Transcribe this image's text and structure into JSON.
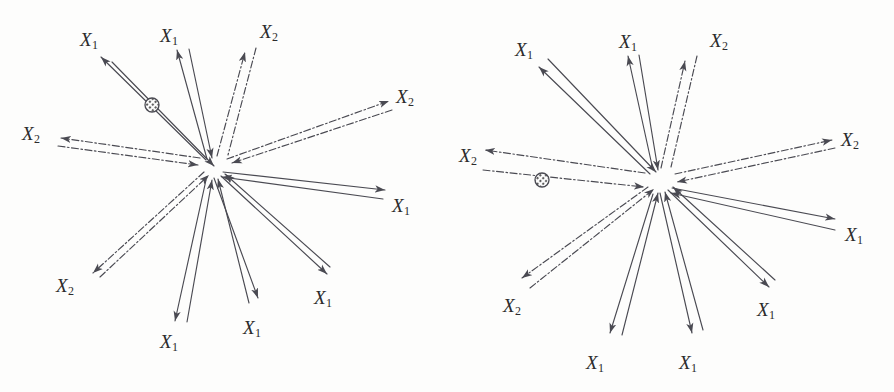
{
  "figure": {
    "background_color": "#fdfdfc",
    "stroke_color": "#4a4a52",
    "label_color": "#2b2b2b",
    "panel_count": 2
  },
  "legend": {
    "x1_symbol": "X",
    "x1_subscript": "1",
    "x2_symbol": "X",
    "x2_subscript": "2",
    "x1_line_style": "solid",
    "x2_line_style": "dash-dot"
  },
  "panels": [
    {
      "id": "panel-left",
      "name": "left-panel",
      "hub": {
        "x": 210,
        "y": 167
      },
      "particle": {
        "x": 152,
        "y": 105,
        "r": 7,
        "name": "hatched-circle-marker"
      },
      "rays": [
        {
          "name": "ray-x1-upper-left",
          "series": "X1",
          "style": "solid",
          "label": "X",
          "sub": "1",
          "label_x": 80,
          "label_y": 30,
          "out": {
            "x1": 206,
            "y1": 160,
            "x2": 101,
            "y2": 57
          },
          "back": {
            "x1": 112,
            "y1": 62,
            "x2": 214,
            "y2": 166
          },
          "out_arrow": true,
          "back_arrow": true
        },
        {
          "name": "ray-x1-upper-mid",
          "series": "X1",
          "style": "solid",
          "label": "X",
          "sub": "1",
          "label_x": 160,
          "label_y": 26,
          "out": {
            "x1": 207,
            "y1": 159,
            "x2": 177,
            "y2": 50
          },
          "back": {
            "x1": 189,
            "y1": 49,
            "x2": 212,
            "y2": 158
          },
          "out_arrow": true,
          "back_arrow": true
        },
        {
          "name": "ray-x2-upper-right",
          "series": "X2",
          "style": "dashdot",
          "label": "X",
          "sub": "2",
          "label_x": 260,
          "label_y": 22,
          "out": {
            "x1": 217,
            "y1": 156,
            "x2": 245,
            "y2": 52
          },
          "back": {
            "x1": 256,
            "y1": 48,
            "x2": 228,
            "y2": 155
          },
          "out_arrow": true,
          "back_arrow": false
        },
        {
          "name": "ray-x2-right",
          "series": "X2",
          "style": "dashdot",
          "label": "X",
          "sub": "2",
          "label_x": 396,
          "label_y": 87,
          "out": {
            "x1": 227,
            "y1": 159,
            "x2": 389,
            "y2": 101
          },
          "back": {
            "x1": 392,
            "y1": 110,
            "x2": 232,
            "y2": 163
          },
          "out_arrow": true,
          "back_arrow": true
        },
        {
          "name": "ray-x2-left",
          "series": "X2",
          "style": "dashdot",
          "label": "X",
          "sub": "2",
          "label_x": 22,
          "label_y": 124,
          "out": {
            "x1": 200,
            "y1": 158,
            "x2": 61,
            "y2": 138
          },
          "back": {
            "x1": 58,
            "y1": 146,
            "x2": 198,
            "y2": 165
          },
          "out_arrow": true,
          "back_arrow": true
        },
        {
          "name": "ray-x1-right",
          "series": "X1",
          "style": "solid",
          "label": "X",
          "sub": "1",
          "label_x": 392,
          "label_y": 196,
          "out": {
            "x1": 223,
            "y1": 172,
            "x2": 385,
            "y2": 190
          },
          "back": {
            "x1": 383,
            "y1": 199,
            "x2": 222,
            "y2": 177
          },
          "out_arrow": true,
          "back_arrow": true
        },
        {
          "name": "ray-x2-lower-left",
          "series": "X2",
          "style": "dashdot",
          "label": "X",
          "sub": "2",
          "label_x": 56,
          "label_y": 276,
          "out": {
            "x1": 204,
            "y1": 172,
            "x2": 93,
            "y2": 273
          },
          "back": {
            "x1": 100,
            "y1": 277,
            "x2": 209,
            "y2": 175
          },
          "out_arrow": true,
          "back_arrow": true
        },
        {
          "name": "ray-x1-lower-left",
          "series": "X1",
          "style": "solid",
          "label": "X",
          "sub": "1",
          "label_x": 160,
          "label_y": 332,
          "out": {
            "x1": 206,
            "y1": 180,
            "x2": 175,
            "y2": 321
          },
          "back": {
            "x1": 187,
            "y1": 322,
            "x2": 212,
            "y2": 180
          },
          "out_arrow": true,
          "back_arrow": true
        },
        {
          "name": "ray-x1-lower-mid",
          "series": "X1",
          "style": "solid",
          "label": "X",
          "sub": "1",
          "label_x": 243,
          "label_y": 318,
          "out": {
            "x1": 214,
            "y1": 178,
            "x2": 258,
            "y2": 298
          },
          "back": {
            "x1": 249,
            "y1": 303,
            "x2": 218,
            "y2": 179
          },
          "out_arrow": true,
          "back_arrow": true
        },
        {
          "name": "ray-x1-lower-right",
          "series": "X1",
          "style": "solid",
          "label": "X",
          "sub": "1",
          "label_x": 314,
          "label_y": 288,
          "out": {
            "x1": 221,
            "y1": 176,
            "x2": 327,
            "y2": 274
          },
          "back": {
            "x1": 330,
            "y1": 267,
            "x2": 225,
            "y2": 174
          },
          "out_arrow": true,
          "back_arrow": true
        }
      ]
    },
    {
      "id": "panel-right",
      "name": "right-panel",
      "hub": {
        "x": 208,
        "y": 180
      },
      "particle": {
        "x": 95,
        "y": 180,
        "r": 7,
        "name": "hatched-circle-marker"
      },
      "rays": [
        {
          "name": "ray-x1-upper-left",
          "series": "X1",
          "style": "solid",
          "label": "X",
          "sub": "1",
          "label_x": 68,
          "label_y": 40,
          "out": {
            "x1": 203,
            "y1": 174,
            "x2": 92,
            "y2": 67
          },
          "back": {
            "x1": 101,
            "y1": 59,
            "x2": 209,
            "y2": 172
          },
          "out_arrow": true,
          "back_arrow": true
        },
        {
          "name": "ray-x1-upper-mid",
          "series": "X1",
          "style": "solid",
          "label": "X",
          "sub": "1",
          "label_x": 172,
          "label_y": 32,
          "out": {
            "x1": 206,
            "y1": 170,
            "x2": 181,
            "y2": 56
          },
          "back": {
            "x1": 192,
            "y1": 55,
            "x2": 211,
            "y2": 170
          },
          "out_arrow": true,
          "back_arrow": true
        },
        {
          "name": "ray-x2-upper-right",
          "series": "X2",
          "style": "dashdot",
          "label": "X",
          "sub": "2",
          "label_x": 263,
          "label_y": 31,
          "out": {
            "x1": 214,
            "y1": 168,
            "x2": 238,
            "y2": 61
          },
          "back": {
            "x1": 250,
            "y1": 56,
            "x2": 224,
            "y2": 167
          },
          "out_arrow": true,
          "back_arrow": false
        },
        {
          "name": "ray-x2-right",
          "series": "X2",
          "style": "dashdot",
          "label": "X",
          "sub": "2",
          "label_x": 394,
          "label_y": 130,
          "out": {
            "x1": 228,
            "y1": 174,
            "x2": 385,
            "y2": 140
          },
          "back": {
            "x1": 388,
            "y1": 148,
            "x2": 230,
            "y2": 182
          },
          "out_arrow": true,
          "back_arrow": true
        },
        {
          "name": "ray-x2-left",
          "series": "X2",
          "style": "dashdot",
          "label": "X",
          "sub": "2",
          "label_x": 12,
          "label_y": 146,
          "out": {
            "x1": 198,
            "y1": 173,
            "x2": 38,
            "y2": 150
          },
          "back": {
            "x1": 36,
            "y1": 170,
            "x2": 197,
            "y2": 187
          },
          "out_arrow": true,
          "back_arrow": true
        },
        {
          "name": "ray-x1-right",
          "series": "X1",
          "style": "solid",
          "label": "X",
          "sub": "1",
          "label_x": 398,
          "label_y": 225,
          "out": {
            "x1": 225,
            "y1": 188,
            "x2": 388,
            "y2": 219
          },
          "back": {
            "x1": 388,
            "y1": 230,
            "x2": 224,
            "y2": 193
          },
          "out_arrow": true,
          "back_arrow": true
        },
        {
          "name": "ray-x2-lower-left",
          "series": "X2",
          "style": "dashdot",
          "label": "X",
          "sub": "2",
          "label_x": 56,
          "label_y": 296,
          "out": {
            "x1": 201,
            "y1": 187,
            "x2": 75,
            "y2": 278
          },
          "back": {
            "x1": 83,
            "y1": 288,
            "x2": 207,
            "y2": 189
          },
          "out_arrow": true,
          "back_arrow": true
        },
        {
          "name": "ray-x1-lower-left",
          "series": "X1",
          "style": "solid",
          "label": "X",
          "sub": "1",
          "label_x": 139,
          "label_y": 353,
          "out": {
            "x1": 206,
            "y1": 194,
            "x2": 163,
            "y2": 333
          },
          "back": {
            "x1": 175,
            "y1": 335,
            "x2": 211,
            "y2": 193
          },
          "out_arrow": true,
          "back_arrow": true
        },
        {
          "name": "ray-x1-lower-mid",
          "series": "X1",
          "style": "solid",
          "label": "X",
          "sub": "1",
          "label_x": 232,
          "label_y": 353,
          "out": {
            "x1": 213,
            "y1": 193,
            "x2": 245,
            "y2": 333
          },
          "back": {
            "x1": 256,
            "y1": 330,
            "x2": 218,
            "y2": 192
          },
          "out_arrow": true,
          "back_arrow": true
        },
        {
          "name": "ray-x1-lower-right",
          "series": "X1",
          "style": "solid",
          "label": "X",
          "sub": "1",
          "label_x": 310,
          "label_y": 300,
          "out": {
            "x1": 221,
            "y1": 190,
            "x2": 322,
            "y2": 287
          },
          "back": {
            "x1": 328,
            "y1": 280,
            "x2": 226,
            "y2": 187
          },
          "out_arrow": true,
          "back_arrow": true
        }
      ]
    }
  ]
}
